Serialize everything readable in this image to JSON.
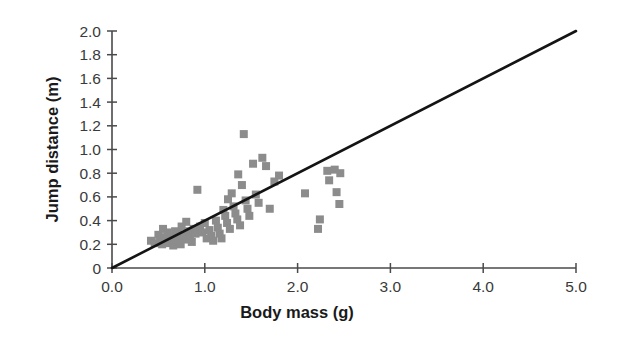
{
  "chart_data": {
    "type": "scatter",
    "title": "",
    "xlabel": "Body mass (g)",
    "ylabel": "Jump distance (m)",
    "xlim": [
      0.0,
      5.0
    ],
    "ylim": [
      0.0,
      2.0
    ],
    "xticks": [
      0.0,
      1.0,
      2.0,
      3.0,
      4.0,
      5.0
    ],
    "xtick_labels": [
      "0.0",
      "1.0",
      "2.0",
      "3.0",
      "4.0",
      "5.0"
    ],
    "yticks": [
      0.0,
      0.2,
      0.4,
      0.6,
      0.8,
      1.0,
      1.2,
      1.4,
      1.6,
      1.8,
      2.0
    ],
    "ytick_labels": [
      "0",
      "0.2",
      "0.4",
      "0.6",
      "0.8",
      "1.0",
      "1.2",
      "1.4",
      "1.6",
      "1.8",
      "2.0"
    ],
    "grid": false,
    "legend": null,
    "marker": "square",
    "marker_color": "#8c8c8c",
    "marker_size": 8,
    "series": [
      {
        "name": "Jump distance vs body mass",
        "points": [
          [
            0.42,
            0.23
          ],
          [
            0.46,
            0.21
          ],
          [
            0.5,
            0.28
          ],
          [
            0.52,
            0.24
          ],
          [
            0.54,
            0.2
          ],
          [
            0.55,
            0.33
          ],
          [
            0.57,
            0.26
          ],
          [
            0.58,
            0.22
          ],
          [
            0.6,
            0.3
          ],
          [
            0.61,
            0.25
          ],
          [
            0.62,
            0.21
          ],
          [
            0.64,
            0.27
          ],
          [
            0.65,
            0.23
          ],
          [
            0.66,
            0.19
          ],
          [
            0.68,
            0.31
          ],
          [
            0.69,
            0.26
          ],
          [
            0.7,
            0.22
          ],
          [
            0.71,
            0.29
          ],
          [
            0.73,
            0.24
          ],
          [
            0.74,
            0.2
          ],
          [
            0.75,
            0.35
          ],
          [
            0.77,
            0.28
          ],
          [
            0.78,
            0.24
          ],
          [
            0.8,
            0.39
          ],
          [
            0.82,
            0.31
          ],
          [
            0.84,
            0.26
          ],
          [
            0.86,
            0.22
          ],
          [
            0.88,
            0.33
          ],
          [
            0.9,
            0.29
          ],
          [
            0.92,
            0.66
          ],
          [
            0.95,
            0.35
          ],
          [
            0.97,
            0.3
          ],
          [
            1.0,
            0.38
          ],
          [
            1.02,
            0.25
          ],
          [
            1.05,
            0.32
          ],
          [
            1.07,
            0.27
          ],
          [
            1.09,
            0.23
          ],
          [
            1.12,
            0.4
          ],
          [
            1.14,
            0.34
          ],
          [
            1.16,
            0.29
          ],
          [
            1.18,
            0.25
          ],
          [
            1.2,
            0.49
          ],
          [
            1.22,
            0.44
          ],
          [
            1.24,
            0.38
          ],
          [
            1.25,
            0.58
          ],
          [
            1.27,
            0.33
          ],
          [
            1.29,
            0.63
          ],
          [
            1.31,
            0.52
          ],
          [
            1.33,
            0.46
          ],
          [
            1.35,
            0.41
          ],
          [
            1.36,
            0.79
          ],
          [
            1.38,
            0.36
          ],
          [
            1.4,
            0.7
          ],
          [
            1.42,
            1.13
          ],
          [
            1.44,
            0.57
          ],
          [
            1.46,
            0.5
          ],
          [
            1.48,
            0.44
          ],
          [
            1.52,
            0.88
          ],
          [
            1.55,
            0.62
          ],
          [
            1.58,
            0.55
          ],
          [
            1.62,
            0.93
          ],
          [
            1.66,
            0.86
          ],
          [
            1.7,
            0.5
          ],
          [
            1.75,
            0.73
          ],
          [
            1.8,
            0.78
          ],
          [
            2.08,
            0.63
          ],
          [
            2.22,
            0.33
          ],
          [
            2.24,
            0.41
          ],
          [
            2.32,
            0.82
          ],
          [
            2.34,
            0.74
          ],
          [
            2.4,
            0.83
          ],
          [
            2.42,
            0.64
          ],
          [
            2.45,
            0.54
          ],
          [
            2.46,
            0.8
          ]
        ]
      }
    ],
    "fit_line": {
      "label": "regression line",
      "x": [
        0.0,
        5.0
      ],
      "y": [
        0.0,
        2.0
      ],
      "slope": 0.4,
      "intercept": 0.0,
      "color": "#141414"
    }
  }
}
